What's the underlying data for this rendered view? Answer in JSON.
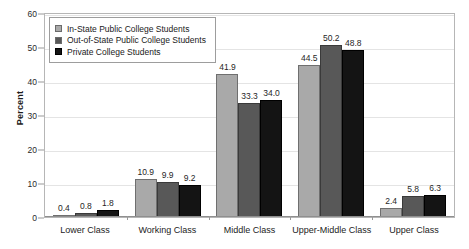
{
  "chart_data": {
    "type": "bar",
    "title": "",
    "xlabel": "",
    "ylabel": "Percent",
    "ylim": [
      0,
      60
    ],
    "yticks": [
      0,
      10,
      20,
      30,
      40,
      50,
      60
    ],
    "grid": true,
    "legend_position": "upper-left-inside",
    "categories": [
      "Lower Class",
      "Working Class",
      "Middle Class",
      "Upper-Middle Class",
      "Upper Class"
    ],
    "series": [
      {
        "name": "In-State Public College Students",
        "color": "#a9a9a9",
        "values": [
          0.4,
          10.9,
          41.9,
          44.5,
          2.4
        ],
        "labels": [
          "0.4",
          "10.9",
          "41.9",
          "44.5",
          "2.4"
        ]
      },
      {
        "name": "Out-of-State Public College Students",
        "color": "#585858",
        "values": [
          0.8,
          9.9,
          33.3,
          50.2,
          5.8
        ],
        "labels": [
          "0.8",
          "9.9",
          "33.3",
          "50.2",
          "5.8"
        ]
      },
      {
        "name": "Private College Students",
        "color": "#141414",
        "values": [
          1.8,
          9.2,
          34.0,
          48.8,
          6.3
        ],
        "labels": [
          "1.8",
          "9.2",
          "34.0",
          "48.8",
          "6.3"
        ]
      }
    ]
  }
}
